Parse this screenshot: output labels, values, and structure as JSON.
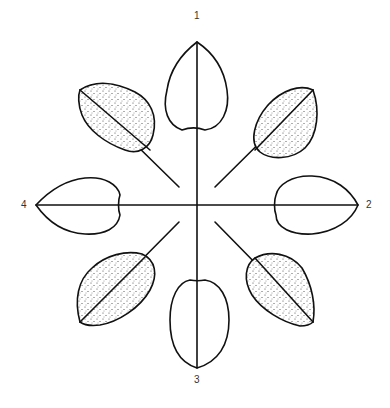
{
  "diagram": {
    "center": [
      197,
      205
    ],
    "labels": [
      {
        "id": "1",
        "text": "1",
        "x": 194,
        "y": 16
      },
      {
        "id": "2",
        "text": "2",
        "x": 366,
        "y": 199
      },
      {
        "id": "3",
        "text": "3",
        "x": 194,
        "y": 349
      },
      {
        "id": "4",
        "text": "4",
        "x": 21,
        "y": 199
      }
    ],
    "colors": {
      "stroke": "#111111",
      "fill": "#ffffff",
      "stipple": "#444444"
    }
  }
}
